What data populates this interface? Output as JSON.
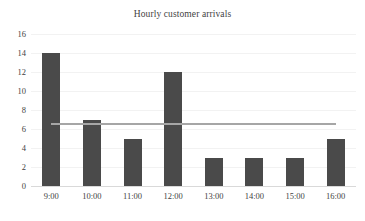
{
  "chart_data": {
    "type": "bar",
    "title": "Hourly customer arrivals",
    "xlabel": "",
    "ylabel": "",
    "categories": [
      "9:00",
      "10:00",
      "11:00",
      "12:00",
      "13:00",
      "14:00",
      "15:00",
      "16:00"
    ],
    "values": [
      14,
      7,
      5,
      12,
      3,
      3,
      3,
      5
    ],
    "series": [
      {
        "name": "Hourly customer arrivals",
        "values": [
          14,
          7,
          5,
          12,
          3,
          3,
          3,
          5
        ],
        "color": "#4a4a4a"
      }
    ],
    "ylim": [
      0,
      16
    ],
    "ytick_step": 2,
    "yticks": [
      "16",
      "14",
      "12",
      "10",
      "8",
      "6",
      "4",
      "2",
      "0"
    ],
    "ytick_values": [
      16,
      14,
      12,
      10,
      8,
      6,
      4,
      2,
      0
    ],
    "grid": true,
    "grid_color": "#f2f2f2",
    "legend": "none",
    "reference_line": {
      "label": "average",
      "value": 6.5,
      "color": "#a6a6a6"
    },
    "colors": {
      "bar": "#4a4a4a",
      "reference_line": "#a6a6a6",
      "gridline": "#f2f2f2",
      "baseline": "#d9d9d9",
      "text": "#3f3f3f",
      "background": "#ffffff"
    }
  }
}
